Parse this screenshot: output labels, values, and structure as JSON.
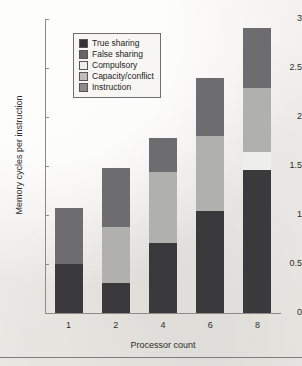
{
  "chart_data": {
    "type": "bar",
    "stacked": true,
    "title": "",
    "xlabel": "Processor count",
    "ylabel": "Memory cycles per instruction",
    "categories": [
      "1",
      "2",
      "4",
      "6",
      "8"
    ],
    "ylim": [
      0,
      3
    ],
    "yticks": [
      "0",
      "0.5",
      "1",
      "1.5",
      "2",
      "2.5",
      "3"
    ],
    "ytick_values": [
      0,
      0.5,
      1,
      1.5,
      2,
      2.5,
      3
    ],
    "grid": false,
    "legend_position": "top-left",
    "stack_order_bottom_to_top": [
      "True sharing",
      "Compulsory",
      "Capacity/conflict",
      "False sharing"
    ],
    "series": [
      {
        "name": "True sharing",
        "color": "#3a3a3c",
        "values": [
          0.5,
          0.31,
          0.71,
          1.04,
          1.46
        ]
      },
      {
        "name": "Compulsory",
        "color": "#eeeeea",
        "values": [
          0.0,
          0.0,
          0.0,
          0.0,
          0.18
        ]
      },
      {
        "name": "Capacity/conflict",
        "color": "#b0b0ad",
        "values": [
          0.0,
          0.57,
          0.73,
          0.77,
          0.66
        ]
      },
      {
        "name": "False sharing",
        "color": "#6d6d70",
        "values": [
          0.57,
          0.6,
          0.35,
          0.59,
          0.61
        ]
      },
      {
        "name": "Instruction",
        "color": "#8e8e90",
        "values": [
          0.0,
          0.0,
          0.0,
          0.0,
          0.0
        ]
      }
    ],
    "totals": [
      1.07,
      1.48,
      1.79,
      2.4,
      2.91
    ]
  },
  "legend": {
    "items": [
      {
        "label": "True sharing",
        "color": "#343437"
      },
      {
        "label": "False sharing",
        "color": "#66666a"
      },
      {
        "label": "Compulsory",
        "color": "#ededea"
      },
      {
        "label": "Capacity/conflict",
        "color": "#bdbdba"
      },
      {
        "label": "Instruction",
        "color": "#8a8a8d"
      }
    ]
  }
}
